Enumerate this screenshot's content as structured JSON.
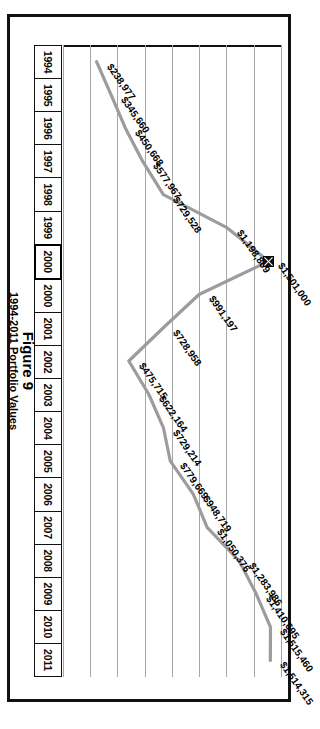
{
  "figure": {
    "title": "Figure 9",
    "subtitle": "1994-2011 Portfolio Values"
  },
  "axis": {
    "cells": [
      {
        "label": "1994",
        "highlight": false
      },
      {
        "label": "1995",
        "highlight": false
      },
      {
        "label": "1996",
        "highlight": false
      },
      {
        "label": "1997",
        "highlight": false
      },
      {
        "label": "1998",
        "highlight": false
      },
      {
        "label": "1999",
        "highlight": false
      },
      {
        "label": "2000",
        "highlight": true
      },
      {
        "label": "2000",
        "highlight": false
      },
      {
        "label": "2001",
        "highlight": false
      },
      {
        "label": "2002",
        "highlight": false
      },
      {
        "label": "2003",
        "highlight": false
      },
      {
        "label": "2004",
        "highlight": false
      },
      {
        "label": "2005",
        "highlight": false
      },
      {
        "label": "2006",
        "highlight": false
      },
      {
        "label": "2007",
        "highlight": false
      },
      {
        "label": "2008",
        "highlight": false
      },
      {
        "label": "2009",
        "highlight": false
      },
      {
        "label": "2010",
        "highlight": false
      },
      {
        "label": "2011",
        "highlight": false
      }
    ]
  },
  "chart_data": {
    "type": "line",
    "title": "Figure 9",
    "subtitle": "1994-2011 Portfolio Values",
    "xlabel": "",
    "ylabel": "",
    "grid": true,
    "legend": false,
    "orientation": "rotated-90-clockwise",
    "categories": [
      "1994",
      "1995",
      "1996",
      "1997",
      "1998",
      "1999",
      "2000",
      "2000",
      "2001",
      "2002",
      "2003",
      "2004",
      "2005",
      "2006",
      "2007",
      "2008",
      "2009",
      "2010",
      "2011"
    ],
    "values": [
      238977,
      345660,
      450668,
      577967,
      729528,
      1198809,
      1501000,
      991197,
      728958,
      475715,
      622164,
      729214,
      779669,
      948719,
      1050376,
      1283986,
      1410695,
      1515460,
      1514315
    ],
    "labels": [
      "$238,977",
      "$345,660",
      "$450,668",
      "$577,967",
      "$729,528",
      "$1,198,809",
      "$1,501,000",
      "$991,197",
      "$728,958",
      "$475,715",
      "$622,164",
      "$729,214",
      "$779,669",
      "$948,719",
      "$1,050,376",
      "$1,283,986",
      "$1,410,695",
      "$1,515,460",
      "$1,514,315"
    ],
    "ylim": [
      0,
      1600000
    ],
    "gridline_count": 8,
    "marker_point": {
      "category": "2000",
      "value": 1501000,
      "label": "$1,501,000",
      "style": "x-in-box"
    },
    "series_color": "#9c9c9c",
    "gridline_color": "#a6a6a6",
    "axis_color": "#111111"
  }
}
